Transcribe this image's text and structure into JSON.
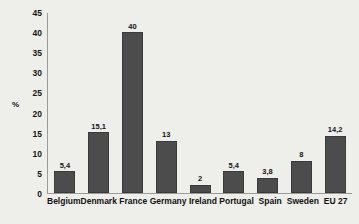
{
  "chart_data": {
    "type": "bar",
    "title": "",
    "subtitle": "",
    "xlabel": "",
    "ylabel": "%",
    "ylim": [
      0,
      45
    ],
    "ystep": 5,
    "grid": false,
    "legend": null,
    "bar_color": "#4c4c4c",
    "background_color": "#eeeeeb",
    "categories": [
      "Belgium",
      "Denmark",
      "France",
      "Germany",
      "Ireland",
      "Portugal",
      "Spain",
      "Sweden",
      "EU 27"
    ],
    "values": [
      5.4,
      15.1,
      40,
      13,
      2,
      5.4,
      3.8,
      8,
      14.2
    ],
    "value_labels": [
      "5,4",
      "15,1",
      "40",
      "13",
      "2",
      "5,4",
      "3,8",
      "8",
      "14,2"
    ],
    "ytick_labels": [
      "45",
      "40",
      "35",
      "30",
      "25",
      "20",
      "15",
      "10",
      "5",
      "0"
    ],
    "ytick_values": [
      45,
      40,
      35,
      30,
      25,
      20,
      15,
      10,
      5,
      0
    ]
  }
}
